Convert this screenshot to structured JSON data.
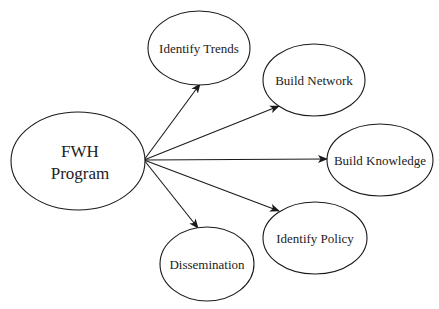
{
  "diagram": {
    "type": "hub-and-spoke",
    "colors": {
      "stroke": "#1a1a1a",
      "text": "#222222",
      "background": "#ffffff"
    },
    "hub": {
      "id": "fwh",
      "label_line1": "FWH",
      "label_line2": "Program",
      "cx": 78,
      "cy": 161,
      "rx": 67,
      "ry": 49
    },
    "origin": {
      "x": 144,
      "y": 160
    },
    "nodes": [
      {
        "id": "identify-trends",
        "label": "Identify Trends",
        "cx": 199,
        "cy": 48,
        "rx": 51,
        "ry": 37,
        "arrow_tip": {
          "x": 200,
          "y": 84
        }
      },
      {
        "id": "build-network",
        "label": "Build Network",
        "cx": 314,
        "cy": 80,
        "rx": 51,
        "ry": 36,
        "arrow_tip": {
          "x": 279,
          "y": 106
        }
      },
      {
        "id": "build-knowledge",
        "label": "Build Knowledge",
        "cx": 380,
        "cy": 160,
        "rx": 53,
        "ry": 36,
        "arrow_tip": {
          "x": 327,
          "y": 159
        }
      },
      {
        "id": "identify-policy",
        "label": "Identify Policy",
        "cx": 315,
        "cy": 238,
        "rx": 52,
        "ry": 36,
        "arrow_tip": {
          "x": 279,
          "y": 211
        }
      },
      {
        "id": "dissemination",
        "label": "Dissemination",
        "cx": 207,
        "cy": 264,
        "rx": 47,
        "ry": 37,
        "arrow_tip": {
          "x": 198,
          "y": 228
        }
      }
    ],
    "edges": [
      {
        "from": "fwh",
        "to": "identify-trends",
        "directed": true
      },
      {
        "from": "fwh",
        "to": "build-network",
        "directed": true
      },
      {
        "from": "fwh",
        "to": "build-knowledge",
        "directed": true
      },
      {
        "from": "fwh",
        "to": "identify-policy",
        "directed": true
      },
      {
        "from": "fwh",
        "to": "dissemination",
        "directed": true
      }
    ]
  }
}
